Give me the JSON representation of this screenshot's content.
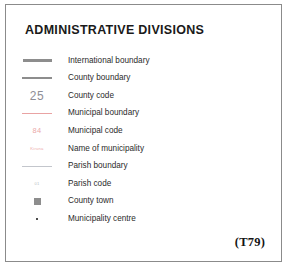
{
  "card": {
    "title": "ADMINISTRATIVE DIVISIONS",
    "caption": "(T79)",
    "border_color": "#8b8b8b",
    "background_color": "#ffffff"
  },
  "legend": {
    "items": [
      {
        "symbol": "thick-grey-line-icon",
        "symbol_kind": "line",
        "symbol_text": "",
        "color": "#8d8d8d",
        "label": "International boundary"
      },
      {
        "symbol": "medium-grey-line-icon",
        "symbol_kind": "line",
        "symbol_text": "",
        "color": "#8d8d8d",
        "label": "County boundary"
      },
      {
        "symbol": "county-code-sample-icon",
        "symbol_kind": "text",
        "symbol_text": "25",
        "color": "#8e8e96",
        "label": "County code"
      },
      {
        "symbol": "thin-pink-line-icon",
        "symbol_kind": "line",
        "symbol_text": "",
        "color": "#e9a3a3",
        "label": "Municipal boundary"
      },
      {
        "symbol": "municipal-code-sample-icon",
        "symbol_kind": "text",
        "symbol_text": "84",
        "color": "#eaa8a8",
        "label": "Municipal code"
      },
      {
        "symbol": "municipality-name-sample-icon",
        "symbol_kind": "text",
        "symbol_text": "Kiruna",
        "color": "#edadad",
        "label": "Name of municipality"
      },
      {
        "symbol": "hairline-grey-line-icon",
        "symbol_kind": "line",
        "symbol_text": "",
        "color": "#c3c6cc",
        "label": "Parish boundary"
      },
      {
        "symbol": "parish-code-sample-icon",
        "symbol_kind": "text",
        "symbol_text": "01",
        "color": "#b9bcc2",
        "label": "Parish code"
      },
      {
        "symbol": "grey-square-icon",
        "symbol_kind": "square",
        "symbol_text": "",
        "color": "#8d8d8d",
        "label": "County town"
      },
      {
        "symbol": "black-dot-icon",
        "symbol_kind": "dot",
        "symbol_text": "",
        "color": "#111111",
        "label": "Municipality centre"
      }
    ]
  }
}
